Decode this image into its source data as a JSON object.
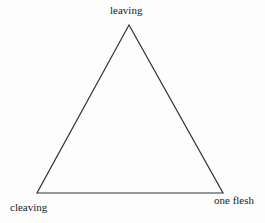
{
  "diagram": {
    "type": "triangle",
    "vertices": {
      "top": {
        "label": "leaving"
      },
      "bottom_left": {
        "label": "cleaving"
      },
      "bottom_right": {
        "label": "one flesh"
      }
    },
    "colors": {
      "line": "#333333",
      "text": "#1a1a1a",
      "background": "#ffffff"
    }
  }
}
